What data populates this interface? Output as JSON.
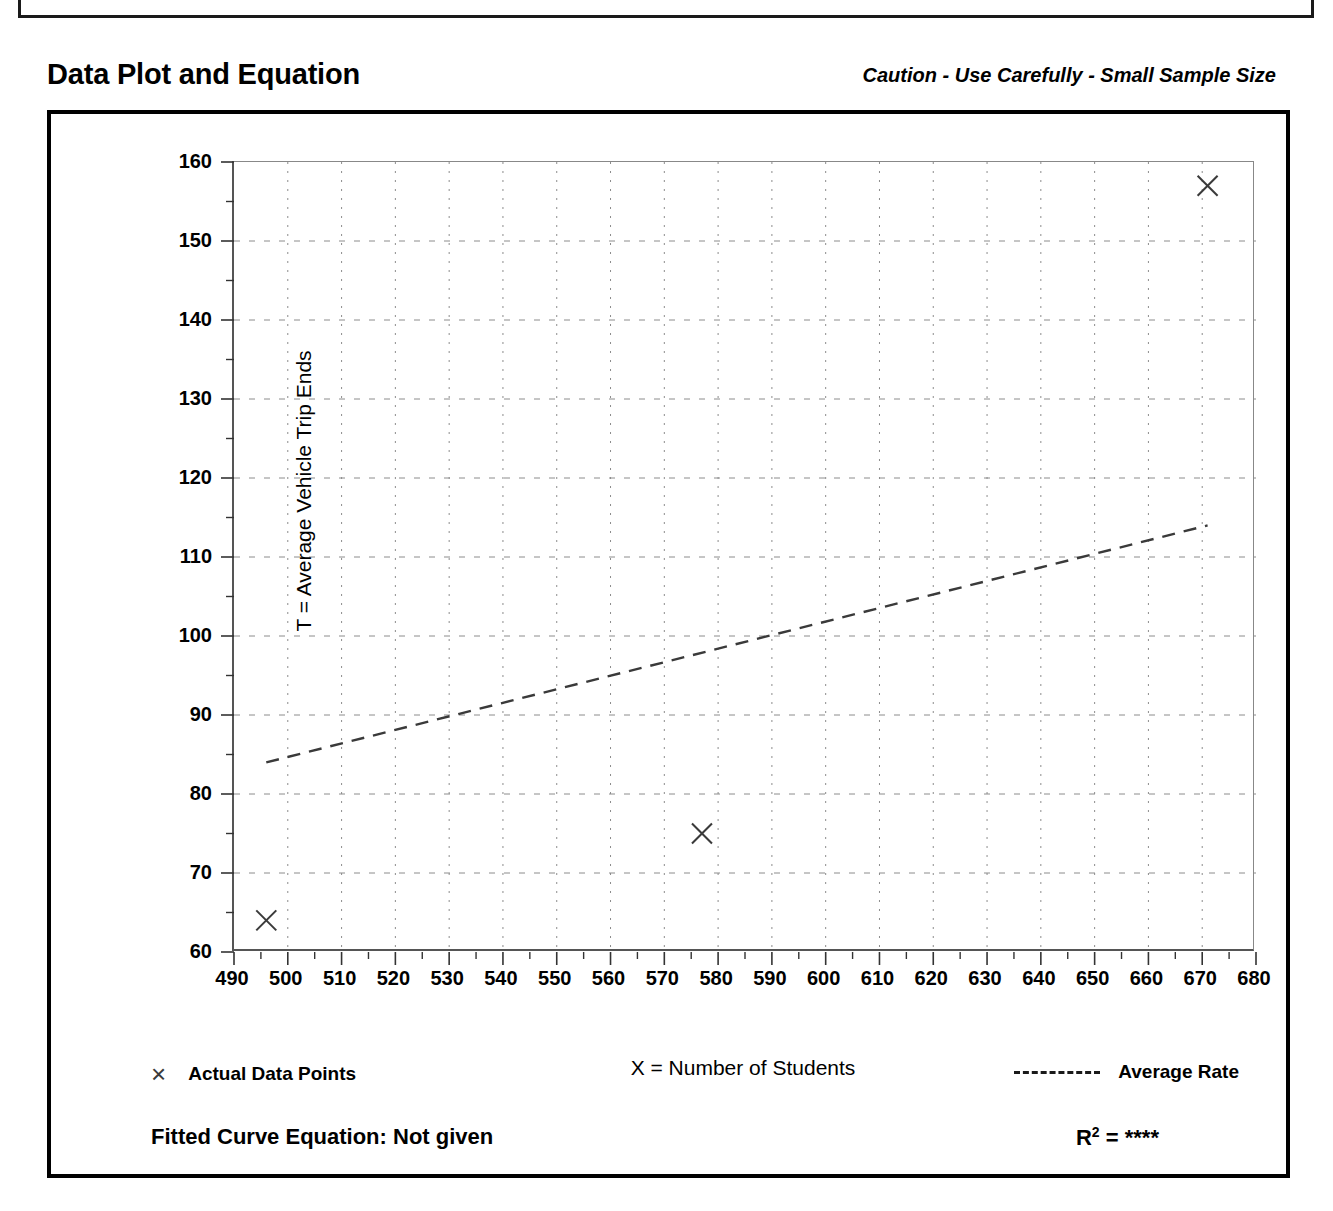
{
  "header": {
    "title": "Data Plot and Equation",
    "caution": "Caution - Use Carefully - Small Sample Size"
  },
  "legend": {
    "data_points_label": "Actual Data Points",
    "average_rate_label": "Average Rate",
    "data_point_marker": "×"
  },
  "footer": {
    "fitted_equation": "Fitted Curve Equation:  Not given",
    "r_squared_prefix": "R",
    "r_squared_exponent": "2",
    "r_squared_value": "= ****"
  },
  "chart_data": {
    "type": "scatter",
    "title": "Data Plot and Equation",
    "subtitle": "Caution - Use Carefully - Small Sample Size",
    "xlabel": "X = Number of Students",
    "ylabel": "T = Average Vehicle Trip Ends",
    "xlim": [
      490,
      680
    ],
    "ylim": [
      60,
      160
    ],
    "xticks": [
      490,
      500,
      510,
      520,
      530,
      540,
      550,
      560,
      570,
      580,
      590,
      600,
      610,
      620,
      630,
      640,
      650,
      660,
      670,
      680
    ],
    "yticks": [
      60,
      70,
      80,
      90,
      100,
      110,
      120,
      130,
      140,
      150,
      160
    ],
    "x_minor_tick_step": 5,
    "y_minor_tick_step": 5,
    "grid": true,
    "grid_style": "dotted",
    "legend_position": "below-plot",
    "series": [
      {
        "name": "Actual Data Points",
        "type": "scatter",
        "marker": "x",
        "points": [
          {
            "x": 496,
            "y": 64
          },
          {
            "x": 577,
            "y": 75
          },
          {
            "x": 671,
            "y": 157
          }
        ]
      },
      {
        "name": "Average Rate",
        "type": "line",
        "style": "dashed",
        "points": [
          {
            "x": 496,
            "y": 84
          },
          {
            "x": 671,
            "y": 114
          }
        ]
      }
    ]
  }
}
